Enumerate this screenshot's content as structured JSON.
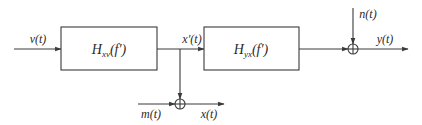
{
  "diagram": {
    "type": "block-diagram",
    "blocks": [
      {
        "id": "hxv",
        "label_main": "H",
        "label_sub": "xv",
        "label_arg": "(f′)"
      },
      {
        "id": "hyx",
        "label_main": "H",
        "label_sub": "yx",
        "label_arg": "(f′)"
      }
    ],
    "signals": {
      "input": "v(t)",
      "intermediate": "x′(t)",
      "measurement_noise": "m(t)",
      "measured_output": "x(t)",
      "output_noise": "n(t)",
      "output": "y(t)"
    },
    "summing_junctions": [
      {
        "id": "sum-measurement",
        "inputs": [
          "x′(t)",
          "m(t)"
        ],
        "output": "x(t)"
      },
      {
        "id": "sum-output",
        "inputs": [
          "H_yx output",
          "n(t)"
        ],
        "output": "y(t)"
      }
    ],
    "connections": [
      [
        "v(t)",
        "hxv"
      ],
      [
        "hxv",
        "x′(t)"
      ],
      [
        "x′(t)",
        "hyx"
      ],
      [
        "x′(t)",
        "sum-measurement"
      ],
      [
        "m(t)",
        "sum-measurement"
      ],
      [
        "sum-measurement",
        "x(t)"
      ],
      [
        "hyx",
        "sum-output"
      ],
      [
        "n(t)",
        "sum-output"
      ],
      [
        "sum-output",
        "y(t)"
      ]
    ]
  }
}
